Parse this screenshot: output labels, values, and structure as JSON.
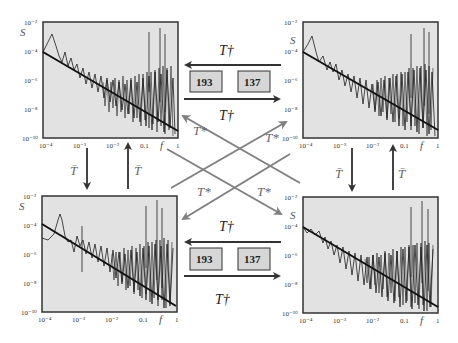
{
  "diagram": {
    "colors": {
      "plot_bg": "#e2e2e2",
      "frame": "#333333",
      "spectrum": "#1e1e1e",
      "fit_line": "#111111",
      "dark_arrow": "#333333",
      "gray_arrow": "#808080",
      "box_fill": "#d6d6d6"
    },
    "operators": {
      "t_dagger": "T†",
      "t_bar": "T̄",
      "t_star": "T*"
    },
    "boxes": {
      "top": [
        "193",
        "137"
      ],
      "bottom": [
        "193",
        "137"
      ]
    },
    "plots": [
      {
        "id": "top-left",
        "ylabel": "S",
        "xlabel": "f"
      },
      {
        "id": "top-right",
        "ylabel": "S",
        "xlabel": "f"
      },
      {
        "id": "bottom-left",
        "ylabel": "S",
        "xlabel": "f"
      },
      {
        "id": "bottom-right",
        "ylabel": "S",
        "xlabel": "f"
      }
    ],
    "axes": {
      "x_ticks": [
        "10⁻⁴",
        "10⁻³",
        "10⁻²",
        "0.1",
        "1"
      ],
      "y_ticks": [
        "10⁻²",
        "10⁻⁴",
        "10⁻⁶",
        "10⁻⁸",
        "10⁻¹⁰"
      ],
      "x_range": [
        0.0001,
        1
      ],
      "y_range": [
        1e-10,
        0.01
      ],
      "scale": "log-log"
    }
  }
}
